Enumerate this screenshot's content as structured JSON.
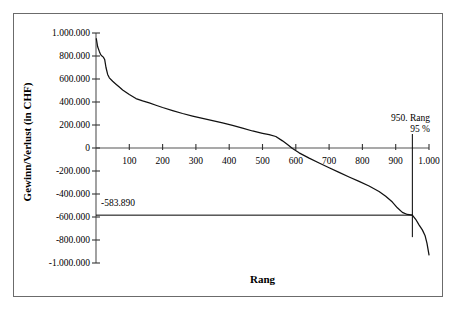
{
  "chart_data": {
    "type": "line",
    "title": "",
    "subtitle": "",
    "xlabel": "Rang",
    "ylabel": "Gewinn/Verlust (in CHF)",
    "xlim": [
      0,
      1000
    ],
    "ylim": [
      -1000000,
      1000000
    ],
    "grid": false,
    "legend": null,
    "x_tick_labels": [
      "100",
      "200",
      "300",
      "400",
      "500",
      "600",
      "700",
      "800",
      "900",
      "1.000"
    ],
    "x_tick_values": [
      100,
      200,
      300,
      400,
      500,
      600,
      700,
      800,
      900,
      1000
    ],
    "y_tick_labels": [
      "1.000.000",
      "800.000",
      "600.000",
      "400.000",
      "200.000",
      "0",
      "-200.000",
      "-400.000",
      "-600.000",
      "-800.000",
      "-1.000.000"
    ],
    "y_tick_values": [
      1000000,
      800000,
      600000,
      400000,
      200000,
      0,
      -200000,
      -400000,
      -600000,
      -800000,
      -1000000
    ],
    "series": [
      {
        "name": "Gewinn/Verlust nach Rang",
        "x": [
          1,
          5,
          10,
          14,
          18,
          22,
          26,
          30,
          35,
          40,
          50,
          60,
          70,
          80,
          90,
          100,
          120,
          140,
          160,
          180,
          200,
          230,
          260,
          290,
          320,
          350,
          380,
          410,
          440,
          470,
          500,
          520,
          540,
          560,
          575,
          590,
          610,
          640,
          670,
          700,
          730,
          760,
          790,
          820,
          850,
          870,
          890,
          905,
          920,
          935,
          950,
          960,
          970,
          980,
          988,
          994,
          1000
        ],
        "y": [
          950000,
          880000,
          840000,
          812000,
          800000,
          790000,
          770000,
          700000,
          640000,
          610000,
          580000,
          555000,
          530000,
          505000,
          485000,
          465000,
          430000,
          410000,
          392000,
          372000,
          352000,
          325000,
          300000,
          278000,
          258000,
          238000,
          218000,
          196000,
          172000,
          148000,
          128000,
          116000,
          100000,
          62000,
          30000,
          -5000,
          -42000,
          -88000,
          -130000,
          -172000,
          -212000,
          -252000,
          -290000,
          -330000,
          -378000,
          -420000,
          -470000,
          -520000,
          -560000,
          -578000,
          -583890,
          -620000,
          -668000,
          -712000,
          -760000,
          -830000,
          -930000
        ]
      }
    ],
    "annotations": [
      {
        "name": "percentile-marker",
        "line1": "950. Rang",
        "line2": "95 %",
        "x": 950,
        "type": "vertical-line"
      },
      {
        "name": "value-at-percentile",
        "label": "-583.890",
        "y": -583890,
        "type": "horizontal-line"
      }
    ]
  }
}
